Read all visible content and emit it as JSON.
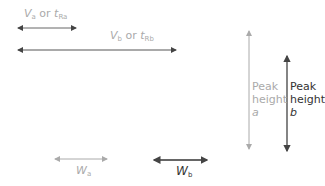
{
  "labels": {
    "va": {
      "main": "V",
      "sub": "a",
      "mid": " or ",
      "main2": "t",
      "sub2": "Ra"
    },
    "vb": {
      "main": "V",
      "sub": "b",
      "mid": " or ",
      "main2": "t",
      "sub2": "Rb"
    },
    "wa": {
      "main": "W",
      "sub": "a"
    },
    "wb": {
      "main": "W",
      "sub": "b"
    },
    "peak_a": {
      "line1": "Peak",
      "line2": "height",
      "line3": "a"
    },
    "peak_b": {
      "line1": "Peak",
      "line2": "height",
      "line3": "b"
    }
  },
  "colors": {
    "grey": "#aaaaaa",
    "dark": "#333333"
  }
}
